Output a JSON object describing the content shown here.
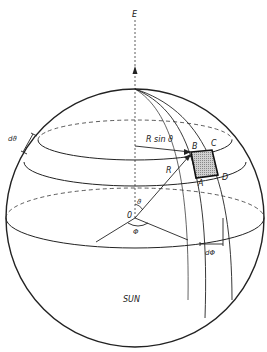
{
  "diagram": {
    "labels": {
      "axis": "E",
      "r_sin_theta": "R sin ϑ",
      "radius": "R",
      "origin": "0",
      "theta": "ϑ",
      "phi": "Φ",
      "d_theta": "dϑ",
      "d_phi": "dΦ",
      "point_a": "A",
      "point_b": "B",
      "point_c": "C",
      "point_d": "D",
      "body": "SUN"
    },
    "colors": {
      "line": "#222222",
      "shaded_element": "#bbbbbb",
      "background": "#ffffff"
    }
  }
}
